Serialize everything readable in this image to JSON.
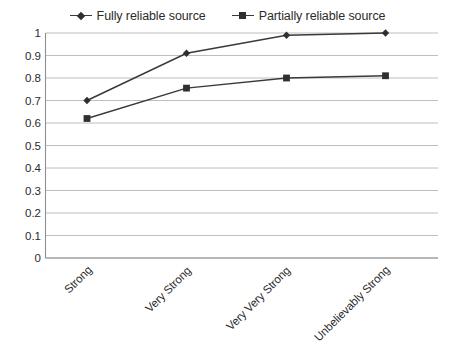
{
  "chart_data": {
    "type": "line",
    "title": "",
    "subtitle": "",
    "xlabel": "",
    "ylabel": "",
    "categories": [
      "Strong",
      "Very Strong",
      "Very Very Strong",
      "Unbelievably Strong"
    ],
    "series": [
      {
        "name": "Fully reliable source",
        "marker": "diamond",
        "color": "#3a3a3a",
        "values": [
          0.7,
          0.91,
          0.99,
          1.0
        ]
      },
      {
        "name": "Partially reliable source",
        "marker": "square",
        "color": "#3a3a3a",
        "values": [
          0.62,
          0.755,
          0.8,
          0.81
        ]
      }
    ],
    "ylim": [
      0,
      1
    ],
    "ytick_values": [
      0,
      0.1,
      0.2,
      0.3,
      0.4,
      0.5,
      0.6,
      0.7,
      0.8,
      0.9,
      1
    ],
    "ytick_labels": [
      "0",
      "0.1",
      "0.2",
      "0.3",
      "0.4",
      "0.5",
      "0.6",
      "0.7",
      "0.8",
      "0.9",
      "1"
    ],
    "grid": true,
    "grid_axis": "y",
    "legend_position": "top",
    "xtick_rotation": -45,
    "background_color": "#ffffff",
    "gridline_color": "#b7b7b7",
    "axis_color": "#8f8f8f"
  },
  "legend": {
    "entries": [
      {
        "label": "Fully reliable source",
        "marker": "diamond"
      },
      {
        "label": "Partially reliable source",
        "marker": "square"
      }
    ]
  }
}
